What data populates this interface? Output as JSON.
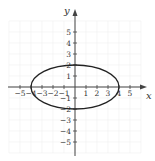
{
  "chart_data": {
    "type": "line",
    "title": "",
    "xlabel": "x",
    "ylabel": "y",
    "xlim": [
      -6,
      6
    ],
    "ylim": [
      -6,
      6
    ],
    "grid": true,
    "x_ticks": [
      -5,
      -4,
      -3,
      -2,
      -1,
      1,
      2,
      3,
      4,
      5
    ],
    "y_ticks": [
      -5,
      -4,
      -3,
      -2,
      -1,
      1,
      2,
      3,
      4,
      5
    ],
    "x_tick_labels": [
      "−5",
      "−4",
      "−3",
      "−2",
      "−1",
      "1",
      "2",
      "3",
      "4",
      "5"
    ],
    "y_tick_labels": [
      "−5",
      "−4",
      "−3",
      "−2",
      "−1",
      "1",
      "2",
      "3",
      "4",
      "5"
    ],
    "series": [
      {
        "name": "ellipse",
        "equation": "x^2/16 + y^2/4 = 1",
        "center": [
          0,
          0
        ],
        "semi_major_x": 4,
        "semi_minor_y": 2,
        "color": "#222222"
      }
    ]
  },
  "axis": {
    "x_label": "x",
    "y_label": "y"
  },
  "colors": {
    "axis": "#444444",
    "grid": "#f0f0f0",
    "curve": "#222222"
  }
}
